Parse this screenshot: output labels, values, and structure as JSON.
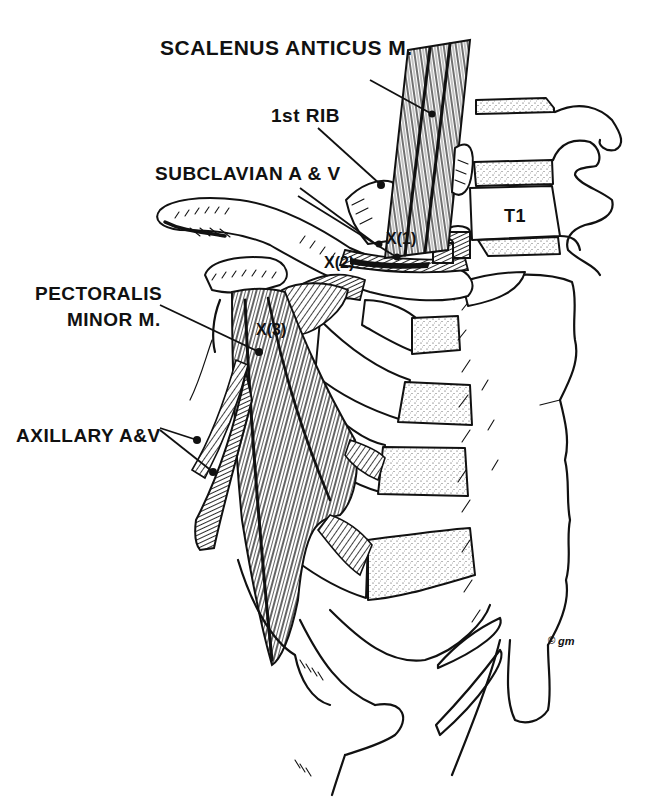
{
  "figure": {
    "type": "anatomical line illustration",
    "background_color": "#ffffff",
    "ink_color": "#111111"
  },
  "labels": {
    "scalenus_anticus": "SCALENUS ANTICUS M.",
    "first_rib": "1st RIB",
    "subclavian": "SUBCLAVIAN A & V",
    "pectoralis_minor_line1": "PECTORALIS",
    "pectoralis_minor_line2": "MINOR M.",
    "axillary": "AXILLARY A&V",
    "vertebra": "T1"
  },
  "compression_sites": [
    {
      "id": "x1",
      "label": "X(1)"
    },
    {
      "id": "x2",
      "label": "X(2)"
    },
    {
      "id": "x3",
      "label": "X(3)"
    }
  ],
  "signature": {
    "copyright_symbol": "©",
    "initials": "gm"
  }
}
